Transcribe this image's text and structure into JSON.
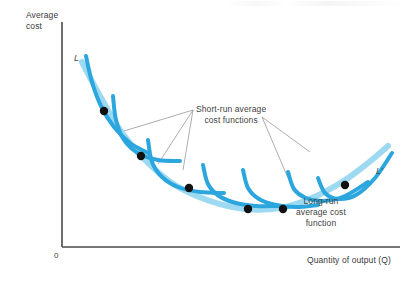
{
  "figure": {
    "background": "#ffffff",
    "axis_color": "#4a4a4a",
    "envelope_color": "#9ED9F2",
    "short_run_color": "#2BA6DE",
    "dot_color": "#111111",
    "leader_color": "#8a8a8a"
  },
  "axes": {
    "y_label": "Average\ncost",
    "x_label": "Quantity of output (Q)",
    "origin_label": "0"
  },
  "curve_labels": {
    "long_run_left": "L",
    "long_run_right": "L'"
  },
  "annotations": {
    "short_run": "Short-run average\ncost functions",
    "long_run": "Long-run\naverage cost\nfunction"
  },
  "chart_data": {
    "type": "line",
    "title": "",
    "xlabel": "Quantity of output (Q)",
    "ylabel": "Average cost",
    "xlim": [
      0,
      100
    ],
    "ylim": [
      0,
      100
    ],
    "grid": false,
    "legend": "none",
    "axis_origin_px": {
      "x": 62,
      "y": 247
    },
    "axis_y_top_px": 22,
    "axis_x_right_px": 400,
    "series": [
      {
        "name": "Long-run average cost function",
        "role": "envelope",
        "color": "#9ED9F2",
        "width": 6,
        "label_start": "L",
        "label_end": "L'",
        "points_px": [
          [
            82,
            62
          ],
          [
            100,
            96
          ],
          [
            120,
            130
          ],
          [
            145,
            160
          ],
          [
            175,
            185
          ],
          [
            210,
            201
          ],
          [
            245,
            209
          ],
          [
            280,
            208
          ],
          [
            312,
            198
          ],
          [
            342,
            182
          ],
          [
            368,
            163
          ],
          [
            388,
            146
          ]
        ]
      },
      {
        "name": "Short-run average cost function 1",
        "role": "short-run",
        "color": "#2BA6DE",
        "width": 4,
        "points_px": [
          [
            86,
            56
          ],
          [
            92,
            82
          ],
          [
            101,
            106
          ],
          [
            114,
            127
          ],
          [
            130,
            143
          ],
          [
            148,
            153
          ]
        ]
      },
      {
        "name": "Short-run average cost function 2",
        "role": "short-run",
        "color": "#2BA6DE",
        "width": 4,
        "points_px": [
          [
            113,
            96
          ],
          [
            116,
            120
          ],
          [
            124,
            140
          ],
          [
            138,
            153
          ],
          [
            158,
            160
          ],
          [
            180,
            161
          ]
        ]
      },
      {
        "name": "Short-run average cost function 3",
        "role": "short-run",
        "color": "#2BA6DE",
        "width": 4,
        "points_px": [
          [
            148,
            140
          ],
          [
            152,
            162
          ],
          [
            162,
            177
          ],
          [
            178,
            187
          ],
          [
            200,
            192
          ],
          [
            224,
            193
          ]
        ]
      },
      {
        "name": "Short-run average cost function 4",
        "role": "short-run",
        "color": "#2BA6DE",
        "width": 4,
        "points_px": [
          [
            203,
            165
          ],
          [
            208,
            184
          ],
          [
            219,
            196
          ],
          [
            236,
            203
          ],
          [
            256,
            206
          ],
          [
            278,
            206
          ]
        ]
      },
      {
        "name": "Short-run average cost function 5",
        "role": "short-run",
        "color": "#2BA6DE",
        "width": 4,
        "points_px": [
          [
            243,
            170
          ],
          [
            248,
            188
          ],
          [
            259,
            199
          ],
          [
            276,
            205
          ],
          [
            296,
            207
          ],
          [
            318,
            205
          ]
        ]
      },
      {
        "name": "Short-run average cost function 6",
        "role": "short-run",
        "color": "#2BA6DE",
        "width": 4,
        "points_px": [
          [
            288,
            172
          ],
          [
            294,
            189
          ],
          [
            306,
            198
          ],
          [
            323,
            201
          ],
          [
            345,
            196
          ],
          [
            368,
            182
          ]
        ]
      },
      {
        "name": "Short-run average cost function 7",
        "role": "short-run",
        "color": "#2BA6DE",
        "width": 4,
        "points_px": [
          [
            318,
            178
          ],
          [
            325,
            193
          ],
          [
            338,
            199
          ],
          [
            356,
            195
          ],
          [
            375,
            178
          ],
          [
            392,
            153
          ]
        ]
      }
    ],
    "tangency_points_px": [
      [
        104,
        111
      ],
      [
        141,
        156
      ],
      [
        189,
        188
      ],
      [
        248,
        209
      ],
      [
        283,
        209
      ],
      [
        345,
        185
      ]
    ],
    "leader_lines_px": [
      {
        "from": [
          193,
          110
        ],
        "to": [
          124,
          131
        ]
      },
      {
        "from": [
          193,
          110
        ],
        "to": [
          158,
          164
        ]
      },
      {
        "from": [
          193,
          110
        ],
        "to": [
          183,
          170
        ]
      },
      {
        "from": [
          262,
          117
        ],
        "to": [
          310,
          152
        ]
      },
      {
        "from": [
          262,
          117
        ],
        "to": [
          288,
          178
        ]
      }
    ]
  }
}
